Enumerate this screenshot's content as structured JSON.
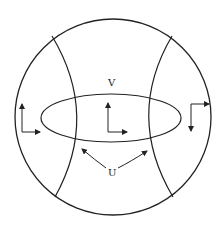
{
  "labels": {
    "v": "V",
    "u": "U"
  },
  "colors": {
    "stroke": "#222222",
    "background": "#ffffff"
  }
}
